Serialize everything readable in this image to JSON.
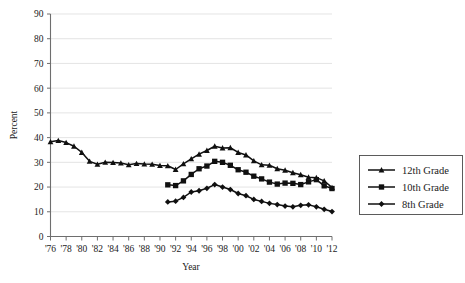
{
  "chart_data": {
    "type": "line",
    "title": "",
    "xlabel": "Year",
    "ylabel": "Percent",
    "ylim": [
      0,
      90
    ],
    "ytick_step": 10,
    "xlim": [
      1976,
      2012
    ],
    "grid": true,
    "legend_position": "right",
    "yticks": [
      "0",
      "10",
      "20",
      "30",
      "40",
      "50",
      "60",
      "70",
      "80",
      "90"
    ],
    "xticks": [
      "'76",
      "'78",
      "'80",
      "'82",
      "'84",
      "'86",
      "'88",
      "'90",
      "'92",
      "'94",
      "'96",
      "'98",
      "'00",
      "'02",
      "'04",
      "'06",
      "'08",
      "'10",
      "'12"
    ],
    "x": [
      1976,
      1977,
      1978,
      1979,
      1980,
      1981,
      1982,
      1983,
      1984,
      1985,
      1986,
      1987,
      1988,
      1989,
      1990,
      1991,
      1992,
      1993,
      1994,
      1995,
      1996,
      1997,
      1998,
      1999,
      2000,
      2001,
      2002,
      2003,
      2004,
      2005,
      2006,
      2007,
      2008,
      2009,
      2010,
      2011,
      2012
    ],
    "series": [
      {
        "name": "12th Grade",
        "marker": "triangle",
        "color": "#101010",
        "start_year": 1976,
        "values": [
          38.3,
          38.8,
          38.0,
          36.5,
          34.0,
          30.4,
          29.2,
          30.0,
          29.9,
          29.7,
          29.0,
          29.5,
          29.3,
          29.2,
          28.7,
          28.6,
          27.1,
          29.4,
          31.4,
          33.3,
          34.8,
          36.5,
          35.8,
          35.9,
          34.0,
          33.0,
          30.6,
          29.0,
          28.8,
          27.4,
          26.8,
          25.8,
          25.0,
          24.0,
          23.8,
          22.5,
          19.8
        ]
      },
      {
        "name": "10th Grade",
        "marker": "square",
        "color": "#101010",
        "start_year": 1991,
        "values": [
          null,
          null,
          null,
          null,
          null,
          null,
          null,
          null,
          null,
          null,
          null,
          null,
          null,
          null,
          null,
          20.9,
          20.6,
          22.5,
          25.1,
          27.4,
          28.5,
          30.4,
          30.0,
          28.8,
          27.0,
          26.0,
          24.4,
          23.3,
          22.0,
          21.2,
          21.6,
          21.5,
          21.0,
          22.1,
          23.0,
          20.5,
          19.4
        ]
      },
      {
        "name": "8th Grade",
        "marker": "diamond",
        "color": "#101010",
        "start_year": 1991,
        "values": [
          null,
          null,
          null,
          null,
          null,
          null,
          null,
          null,
          null,
          null,
          null,
          null,
          null,
          null,
          null,
          14.0,
          14.3,
          15.8,
          18.0,
          18.5,
          19.5,
          21.0,
          20.0,
          19.0,
          17.4,
          16.5,
          15.0,
          14.2,
          13.4,
          12.9,
          12.3,
          12.0,
          12.6,
          12.8,
          12.0,
          11.0,
          10.1
        ]
      }
    ],
    "legend": [
      {
        "label": "12th Grade",
        "marker": "triangle"
      },
      {
        "label": "10th Grade",
        "marker": "square"
      },
      {
        "label": "8th Grade",
        "marker": "diamond"
      }
    ]
  }
}
